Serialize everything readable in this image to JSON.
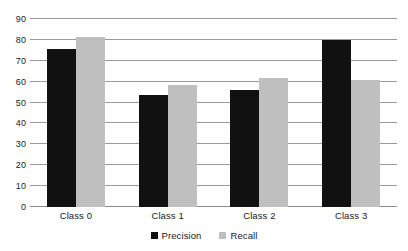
{
  "chart_data": {
    "type": "bar",
    "title": "",
    "xlabel": "",
    "ylabel": "",
    "categories": [
      "Class 0",
      "Class 1",
      "Class 2",
      "Class 3"
    ],
    "series": [
      {
        "name": "Precision",
        "color": "#111111",
        "values": [
          75.5,
          53.5,
          56.0,
          80.0
        ]
      },
      {
        "name": "Recall",
        "color": "#bfbfbf",
        "values": [
          81.5,
          58.5,
          62.0,
          61.0
        ]
      }
    ],
    "ylim": [
      0,
      90
    ],
    "yticks": [
      90,
      80,
      70,
      60,
      50,
      40,
      30,
      20,
      10,
      0
    ],
    "ytick_labels": [
      "90",
      "80",
      "70",
      "60",
      "50",
      "40",
      "30",
      "20",
      "10",
      "0"
    ],
    "grid": true,
    "grid_color": "#9a9a9a",
    "legend_position": "bottom",
    "legend": [
      "Precision",
      "Recall"
    ],
    "background": "#ffffff"
  }
}
